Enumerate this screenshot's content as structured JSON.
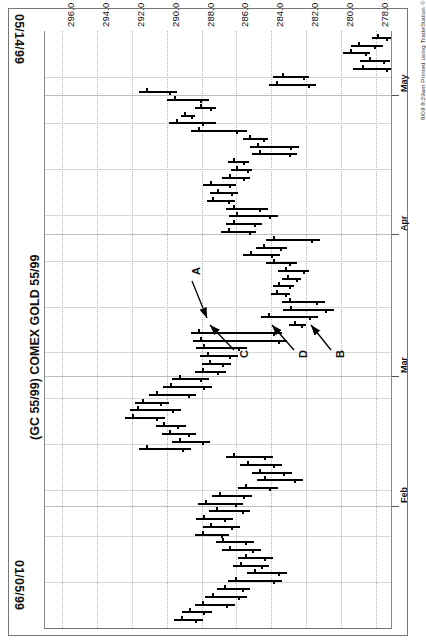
{
  "header": {
    "date_start": "01/05/99",
    "date_end": "05/14/99",
    "title": "(GC 55/99) COMEX GOLD 55/99",
    "quote_line": "COMEX GOLD 55/99-Daily  08/06/99  C=258.3  +.7  O=257.8  H=258.7  L=257.0  V=28954",
    "copyright": "8/09 8:29am Printed using TradeStation © Omega Research, Inc. 1997"
  },
  "annotations": [
    {
      "label": "A",
      "x": 190,
      "y": 275
    },
    {
      "label": "C",
      "x": 238,
      "y": 358
    },
    {
      "label": "D",
      "x": 297,
      "y": 358
    },
    {
      "label": "B",
      "x": 334,
      "y": 358
    }
  ],
  "chart_data": {
    "type": "bar",
    "chart_kind": "ohlc-bar",
    "orientation": "rotated-90",
    "title": "(GC 55/99) COMEX GOLD 55/99",
    "subtitle": "COMEX GOLD 55/99-Daily",
    "xlabel": "Date",
    "ylabel": "Price",
    "grid": true,
    "legend": false,
    "xlim": [
      "01/05/99",
      "05/14/99"
    ],
    "ylim": [
      277.0,
      297.0
    ],
    "price_ticks": [
      296.0,
      294.0,
      292.0,
      290.0,
      288.0,
      286.0,
      284.0,
      282.0,
      280.0,
      278.0
    ],
    "month_ticks": [
      {
        "label": "May",
        "pos": 0.108
      },
      {
        "label": "Apr",
        "pos": 0.34
      },
      {
        "label": "Mar",
        "pos": 0.578
      },
      {
        "label": "Feb",
        "pos": 0.796
      }
    ],
    "last_quote": {
      "symbol": "COMEX GOLD 55/99",
      "interval": "Daily",
      "date": "08/06/99",
      "close": 258.3,
      "change": 0.7,
      "open": 257.8,
      "high": 258.7,
      "low": 257.0,
      "volume": 28954
    },
    "bars": [
      {
        "t": 0.01,
        "low": 278.2,
        "high": 277.0,
        "open": 277.9,
        "close": 277.4
      },
      {
        "t": 0.023,
        "low": 279.4,
        "high": 277.6,
        "open": 279.0,
        "close": 278.1
      },
      {
        "t": 0.036,
        "low": 279.9,
        "high": 278.3,
        "open": 279.5,
        "close": 278.6
      },
      {
        "t": 0.049,
        "low": 278.9,
        "high": 277.2,
        "open": 278.4,
        "close": 277.6
      },
      {
        "t": 0.062,
        "low": 279.3,
        "high": 277.0,
        "open": 278.8,
        "close": 277.4
      },
      {
        "t": 0.075,
        "low": 283.9,
        "high": 281.8,
        "open": 283.4,
        "close": 282.2
      },
      {
        "t": 0.088,
        "low": 284.1,
        "high": 281.4,
        "open": 283.7,
        "close": 281.9
      },
      {
        "t": 0.101,
        "low": 291.6,
        "high": 289.4,
        "open": 291.2,
        "close": 289.9
      },
      {
        "t": 0.114,
        "low": 290.0,
        "high": 287.6,
        "open": 289.6,
        "close": 288.1
      },
      {
        "t": 0.127,
        "low": 288.4,
        "high": 287.2,
        "open": 288.1,
        "close": 287.5
      },
      {
        "t": 0.14,
        "low": 289.2,
        "high": 288.4,
        "open": 289.0,
        "close": 288.6
      },
      {
        "t": 0.153,
        "low": 289.9,
        "high": 287.2,
        "open": 289.5,
        "close": 288.0
      },
      {
        "t": 0.166,
        "low": 288.6,
        "high": 285.4,
        "open": 288.2,
        "close": 286.0
      },
      {
        "t": 0.179,
        "low": 285.6,
        "high": 284.2,
        "open": 285.3,
        "close": 284.5
      },
      {
        "t": 0.192,
        "low": 285.2,
        "high": 282.4,
        "open": 284.8,
        "close": 282.9
      },
      {
        "t": 0.205,
        "low": 285.1,
        "high": 282.5,
        "open": 284.7,
        "close": 283.0
      },
      {
        "t": 0.218,
        "low": 286.5,
        "high": 285.3,
        "open": 286.2,
        "close": 285.6
      },
      {
        "t": 0.231,
        "low": 286.3,
        "high": 285.1,
        "open": 286.0,
        "close": 285.4
      },
      {
        "t": 0.244,
        "low": 286.8,
        "high": 285.2,
        "open": 286.4,
        "close": 285.6
      },
      {
        "t": 0.257,
        "low": 287.9,
        "high": 286.0,
        "open": 287.5,
        "close": 286.4
      },
      {
        "t": 0.27,
        "low": 287.5,
        "high": 285.9,
        "open": 287.1,
        "close": 286.3
      },
      {
        "t": 0.283,
        "low": 287.7,
        "high": 286.1,
        "open": 287.4,
        "close": 286.5
      },
      {
        "t": 0.296,
        "low": 286.6,
        "high": 284.2,
        "open": 286.2,
        "close": 284.7
      },
      {
        "t": 0.309,
        "low": 286.4,
        "high": 283.6,
        "open": 286.0,
        "close": 284.1
      },
      {
        "t": 0.322,
        "low": 286.6,
        "high": 284.5,
        "open": 286.2,
        "close": 285.0
      },
      {
        "t": 0.335,
        "low": 286.9,
        "high": 284.9,
        "open": 286.5,
        "close": 285.3
      },
      {
        "t": 0.348,
        "low": 284.3,
        "high": 281.2,
        "open": 283.9,
        "close": 281.7
      },
      {
        "t": 0.361,
        "low": 284.9,
        "high": 283.1,
        "open": 284.5,
        "close": 283.5
      },
      {
        "t": 0.374,
        "low": 285.6,
        "high": 283.5,
        "open": 285.2,
        "close": 284.0
      },
      {
        "t": 0.387,
        "low": 284.3,
        "high": 282.5,
        "open": 283.9,
        "close": 283.0
      },
      {
        "t": 0.4,
        "low": 283.6,
        "high": 281.8,
        "open": 283.2,
        "close": 282.2
      },
      {
        "t": 0.413,
        "low": 283.4,
        "high": 282.3,
        "open": 283.1,
        "close": 282.6
      },
      {
        "t": 0.426,
        "low": 283.9,
        "high": 282.7,
        "open": 283.6,
        "close": 283.0
      },
      {
        "t": 0.439,
        "low": 284.0,
        "high": 282.9,
        "open": 283.7,
        "close": 283.2
      },
      {
        "t": 0.452,
        "low": 283.4,
        "high": 280.9,
        "open": 283.0,
        "close": 281.4
      },
      {
        "t": 0.465,
        "low": 283.3,
        "high": 280.4,
        "open": 282.9,
        "close": 280.9
      },
      {
        "t": 0.478,
        "low": 284.6,
        "high": 281.3,
        "open": 284.2,
        "close": 281.8
      },
      {
        "t": 0.491,
        "low": 283.0,
        "high": 282.0,
        "open": 282.7,
        "close": 282.3
      },
      {
        "t": 0.504,
        "low": 288.6,
        "high": 283.4,
        "open": 288.2,
        "close": 283.9
      },
      {
        "t": 0.517,
        "low": 288.5,
        "high": 283.1,
        "open": 288.1,
        "close": 283.6
      },
      {
        "t": 0.53,
        "low": 288.3,
        "high": 285.4,
        "open": 287.9,
        "close": 285.9
      },
      {
        "t": 0.543,
        "low": 288.1,
        "high": 285.9,
        "open": 287.7,
        "close": 286.4
      },
      {
        "t": 0.556,
        "low": 288.0,
        "high": 286.3,
        "open": 287.6,
        "close": 286.8
      },
      {
        "t": 0.569,
        "low": 288.4,
        "high": 286.6,
        "open": 288.0,
        "close": 287.1
      },
      {
        "t": 0.582,
        "low": 289.7,
        "high": 287.6,
        "open": 289.3,
        "close": 288.1
      },
      {
        "t": 0.595,
        "low": 290.2,
        "high": 287.4,
        "open": 289.8,
        "close": 287.9
      },
      {
        "t": 0.608,
        "low": 291.0,
        "high": 288.3,
        "open": 290.6,
        "close": 288.8
      },
      {
        "t": 0.621,
        "low": 291.8,
        "high": 289.9,
        "open": 291.4,
        "close": 290.4
      },
      {
        "t": 0.634,
        "low": 292.1,
        "high": 289.2,
        "open": 291.7,
        "close": 289.7
      },
      {
        "t": 0.647,
        "low": 292.4,
        "high": 290.1,
        "open": 292.0,
        "close": 290.6
      },
      {
        "t": 0.66,
        "low": 290.6,
        "high": 288.9,
        "open": 290.2,
        "close": 289.4
      },
      {
        "t": 0.673,
        "low": 290.3,
        "high": 288.3,
        "open": 289.9,
        "close": 288.8
      },
      {
        "t": 0.686,
        "low": 289.7,
        "high": 287.5,
        "open": 289.3,
        "close": 288.0
      },
      {
        "t": 0.699,
        "low": 291.6,
        "high": 288.6,
        "open": 291.2,
        "close": 289.1
      },
      {
        "t": 0.712,
        "low": 286.6,
        "high": 283.9,
        "open": 286.2,
        "close": 284.4
      },
      {
        "t": 0.725,
        "low": 285.8,
        "high": 283.4,
        "open": 285.4,
        "close": 283.9
      },
      {
        "t": 0.738,
        "low": 285.1,
        "high": 282.8,
        "open": 284.7,
        "close": 283.3
      },
      {
        "t": 0.751,
        "low": 284.8,
        "high": 282.2,
        "open": 284.4,
        "close": 282.7
      },
      {
        "t": 0.764,
        "low": 285.9,
        "high": 283.6,
        "open": 285.5,
        "close": 284.1
      },
      {
        "t": 0.777,
        "low": 287.4,
        "high": 285.1,
        "open": 287.0,
        "close": 285.6
      },
      {
        "t": 0.79,
        "low": 288.2,
        "high": 285.6,
        "open": 287.8,
        "close": 286.1
      },
      {
        "t": 0.803,
        "low": 287.6,
        "high": 285.2,
        "open": 287.2,
        "close": 285.7
      },
      {
        "t": 0.816,
        "low": 288.3,
        "high": 286.2,
        "open": 287.9,
        "close": 286.7
      },
      {
        "t": 0.829,
        "low": 287.9,
        "high": 285.8,
        "open": 287.5,
        "close": 286.3
      },
      {
        "t": 0.842,
        "low": 288.4,
        "high": 286.4,
        "open": 288.0,
        "close": 286.9
      },
      {
        "t": 0.855,
        "low": 287.2,
        "high": 285.0,
        "open": 286.8,
        "close": 285.5
      },
      {
        "t": 0.868,
        "low": 286.8,
        "high": 284.6,
        "open": 286.4,
        "close": 285.1
      },
      {
        "t": 0.881,
        "low": 285.9,
        "high": 283.9,
        "open": 285.5,
        "close": 284.4
      },
      {
        "t": 0.894,
        "low": 286.2,
        "high": 284.1,
        "open": 285.8,
        "close": 284.6
      },
      {
        "t": 0.907,
        "low": 285.4,
        "high": 283.1,
        "open": 285.0,
        "close": 283.6
      },
      {
        "t": 0.92,
        "low": 286.5,
        "high": 283.4,
        "open": 286.1,
        "close": 283.9
      },
      {
        "t": 0.933,
        "low": 287.1,
        "high": 285.2,
        "open": 286.7,
        "close": 285.7
      },
      {
        "t": 0.946,
        "low": 287.8,
        "high": 285.4,
        "open": 287.4,
        "close": 285.9
      },
      {
        "t": 0.959,
        "low": 288.4,
        "high": 286.1,
        "open": 288.0,
        "close": 286.6
      },
      {
        "t": 0.972,
        "low": 289.1,
        "high": 287.4,
        "open": 288.7,
        "close": 287.9
      },
      {
        "t": 0.985,
        "low": 289.6,
        "high": 287.9,
        "open": 289.2,
        "close": 288.4
      }
    ]
  }
}
